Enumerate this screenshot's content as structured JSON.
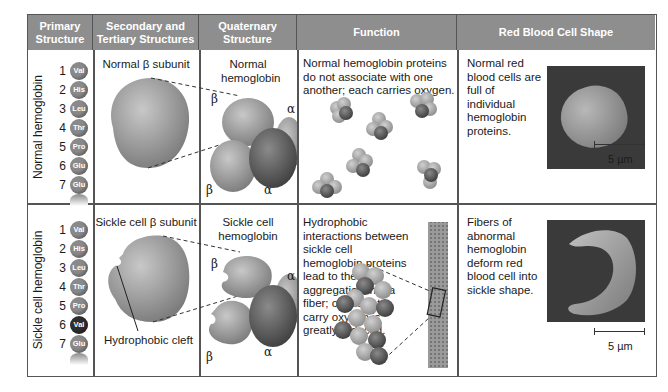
{
  "headers": [
    {
      "label": "Primary Structure"
    },
    {
      "label": "Secondary and Tertiary Structures"
    },
    {
      "label": "Quaternary Structure"
    },
    {
      "label": "Function"
    },
    {
      "label": "Red Blood Cell Shape"
    }
  ],
  "rows": [
    {
      "row_label": "Normal hemoglobin",
      "primary": [
        {
          "pos": "1",
          "aa": "Val"
        },
        {
          "pos": "2",
          "aa": "His"
        },
        {
          "pos": "3",
          "aa": "Leu"
        },
        {
          "pos": "4",
          "aa": "Thr"
        },
        {
          "pos": "5",
          "aa": "Pro"
        },
        {
          "pos": "6",
          "aa": "Glu"
        },
        {
          "pos": "7",
          "aa": "Glu"
        }
      ],
      "tertiary_title": "Normal β subunit",
      "quaternary_title": "Normal hemoglobin",
      "subunit_labels": {
        "beta": "β",
        "alpha": "α"
      },
      "function_text": "Normal hemoglobin proteins do not associate with one another; each carries oxygen.",
      "rbc_text": "Normal red blood cells are full of individual hemoglobin proteins.",
      "scale_label": "5 µm"
    },
    {
      "row_label": "Sickle cell hemoglobin",
      "primary": [
        {
          "pos": "1",
          "aa": "Val"
        },
        {
          "pos": "2",
          "aa": "His"
        },
        {
          "pos": "3",
          "aa": "Leu"
        },
        {
          "pos": "4",
          "aa": "Thr"
        },
        {
          "pos": "5",
          "aa": "Pro"
        },
        {
          "pos": "6",
          "aa": "Val",
          "mutated": true
        },
        {
          "pos": "7",
          "aa": "Glu"
        }
      ],
      "tertiary_title": "Sickle cell β subunit",
      "tertiary_callout": "Hydrophobic cleft",
      "quaternary_title": "Sickle cell hemoglobin",
      "subunit_labels": {
        "beta": "β",
        "alpha": "α"
      },
      "function_text": "Hydrophobic interactions between sickle cell hemoglobin proteins lead to their aggregation into a fiber; capacity to carry oxygen is greatly reduced.",
      "rbc_text": "Fibers of abnormal hemoglobin deform red blood cell into sickle shape.",
      "scale_label": "5 µm"
    }
  ],
  "colors": {
    "header_bg": "#8e8e8e",
    "bead": "#8a8a8a",
    "bead_mutated": "#2e2e2e",
    "border": "#555555"
  }
}
